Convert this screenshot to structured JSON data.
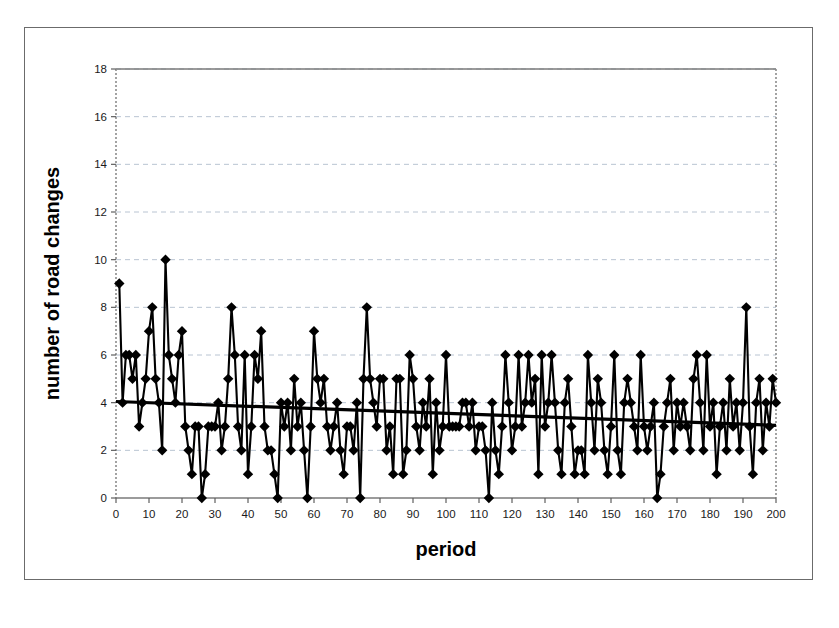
{
  "figure": {
    "axis_titles": {
      "x": "period",
      "y": "number of road changes"
    }
  },
  "chart_data": {
    "type": "line",
    "title": "",
    "subtitle": "",
    "xlabel": "period",
    "ylabel": "number of road changes",
    "xlim": [
      0,
      200
    ],
    "ylim": [
      0,
      18
    ],
    "xticks": [
      0,
      10,
      20,
      30,
      40,
      50,
      60,
      70,
      80,
      90,
      100,
      110,
      120,
      130,
      140,
      150,
      160,
      170,
      180,
      190,
      200
    ],
    "yticks": [
      0,
      2,
      4,
      6,
      8,
      10,
      12,
      14,
      16,
      18
    ],
    "grid": "horizontal-dashed",
    "legend": "none",
    "marker": "diamond",
    "marker_color": "#000000",
    "line_color": "#000000",
    "trend": {
      "type": "linear",
      "label": "",
      "x": [
        0,
        200
      ],
      "y": [
        4.05,
        3.05
      ],
      "color": "#000000"
    },
    "x": [
      1,
      2,
      3,
      4,
      5,
      6,
      7,
      8,
      9,
      10,
      11,
      12,
      13,
      14,
      15,
      16,
      17,
      18,
      19,
      20,
      21,
      22,
      23,
      24,
      25,
      26,
      27,
      28,
      29,
      30,
      31,
      32,
      33,
      34,
      35,
      36,
      37,
      38,
      39,
      40,
      41,
      42,
      43,
      44,
      45,
      46,
      47,
      48,
      49,
      50,
      51,
      52,
      53,
      54,
      55,
      56,
      57,
      58,
      59,
      60,
      61,
      62,
      63,
      64,
      65,
      66,
      67,
      68,
      69,
      70,
      71,
      72,
      73,
      74,
      75,
      76,
      77,
      78,
      79,
      80,
      81,
      82,
      83,
      84,
      85,
      86,
      87,
      88,
      89,
      90,
      91,
      92,
      93,
      94,
      95,
      96,
      97,
      98,
      99,
      100,
      101,
      102,
      103,
      104,
      105,
      106,
      107,
      108,
      109,
      110,
      111,
      112,
      113,
      114,
      115,
      116,
      117,
      118,
      119,
      120,
      121,
      122,
      123,
      124,
      125,
      126,
      127,
      128,
      129,
      130,
      131,
      132,
      133,
      134,
      135,
      136,
      137,
      138,
      139,
      140,
      141,
      142,
      143,
      144,
      145,
      146,
      147,
      148,
      149,
      150,
      151,
      152,
      153,
      154,
      155,
      156,
      157,
      158,
      159,
      160,
      161,
      162,
      163,
      164,
      165,
      166,
      167,
      168,
      169,
      170,
      171,
      172,
      173,
      174,
      175,
      176,
      177,
      178,
      179,
      180,
      181,
      182,
      183,
      184,
      185,
      186,
      187,
      188,
      189,
      190,
      191,
      192,
      193,
      194,
      195,
      196,
      197,
      198,
      199,
      200
    ],
    "values": [
      9,
      4,
      6,
      6,
      5,
      6,
      3,
      4,
      5,
      7,
      8,
      5,
      4,
      2,
      10,
      6,
      5,
      4,
      6,
      7,
      3,
      2,
      1,
      3,
      3,
      0,
      1,
      3,
      3,
      3,
      4,
      2,
      3,
      5,
      8,
      6,
      3,
      2,
      6,
      1,
      3,
      6,
      5,
      7,
      3,
      2,
      2,
      1,
      0,
      4,
      3,
      4,
      2,
      5,
      3,
      4,
      2,
      0,
      3,
      7,
      5,
      4,
      5,
      3,
      2,
      3,
      4,
      2,
      1,
      3,
      3,
      2,
      4,
      0,
      5,
      8,
      5,
      4,
      3,
      5,
      5,
      2,
      3,
      1,
      5,
      5,
      1,
      2,
      6,
      5,
      3,
      2,
      4,
      3,
      5,
      1,
      4,
      2,
      3,
      6,
      3,
      3,
      3,
      3,
      4,
      4,
      3,
      4,
      2,
      3,
      3,
      2,
      0,
      4,
      2,
      1,
      3,
      6,
      4,
      2,
      3,
      6,
      3,
      4,
      6,
      4,
      5,
      1,
      6,
      3,
      4,
      6,
      4,
      2,
      1,
      4,
      5,
      3,
      1,
      2,
      2,
      1,
      6,
      4,
      2,
      5,
      4,
      2,
      1,
      3,
      6,
      2,
      1,
      4,
      5,
      4,
      3,
      2,
      6,
      3,
      2,
      3,
      4,
      0,
      1,
      3,
      4,
      5,
      2,
      4,
      3,
      4,
      3,
      2,
      5,
      6,
      4,
      2,
      6,
      3,
      4,
      1,
      3,
      4,
      2,
      5,
      3,
      4,
      2,
      4,
      8,
      3,
      1,
      4,
      5,
      2,
      4,
      3,
      5,
      4
    ]
  }
}
